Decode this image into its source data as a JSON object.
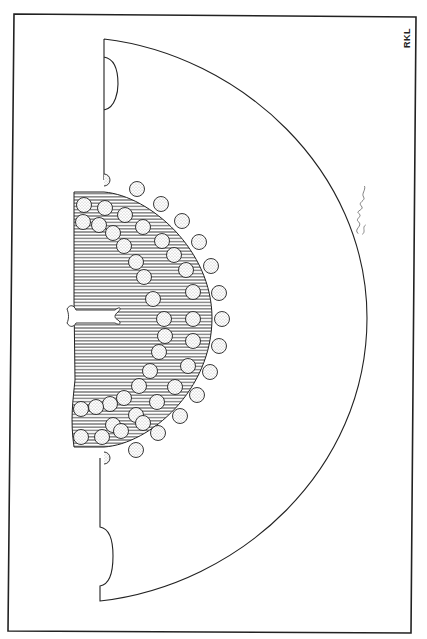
{
  "figure": {
    "type": "archaeological line drawing",
    "stroke_color": "#222222",
    "fill_color": "#ffffff"
  },
  "labels": {
    "initials": "RKL",
    "signature": "signature (handwritten)"
  },
  "frame": {
    "points": [
      [
        14,
        14
      ],
      [
        416,
        17
      ],
      [
        411,
        633
      ],
      [
        8,
        631
      ]
    ]
  },
  "axe": {
    "top_corner": [
      104,
      39
    ],
    "bottom_corner": [
      100,
      601
    ],
    "blade_apex": [
      367,
      315
    ],
    "top_notch": {
      "y1": 57,
      "y2": 110,
      "bulge_x": 118
    },
    "bottom_notch": {
      "y1": 527,
      "y2": 586,
      "bulge_x": 113
    }
  },
  "hatched_region": {
    "top_y": 192,
    "bottom_y": 447,
    "left_x": 74,
    "right_x": 212,
    "line_spacing": 3.2
  },
  "perforations": {
    "radius": 7.5,
    "outer_row": [
      [
        137,
        189
      ],
      [
        161,
        204
      ],
      [
        182,
        221
      ],
      [
        199,
        242
      ],
      [
        211,
        266
      ],
      [
        219,
        293
      ],
      [
        222,
        319
      ],
      [
        219,
        346
      ],
      [
        210,
        372
      ],
      [
        197,
        395
      ],
      [
        180,
        416
      ],
      [
        158,
        433
      ],
      [
        136,
        450
      ]
    ],
    "inner_row": [
      [
        84,
        205
      ],
      [
        105,
        208
      ],
      [
        125,
        215
      ],
      [
        143,
        227
      ],
      [
        162,
        241
      ],
      [
        174,
        255
      ],
      [
        186,
        270
      ],
      [
        193,
        292
      ],
      [
        193,
        319
      ],
      [
        193,
        341
      ],
      [
        188,
        366
      ],
      [
        175,
        387
      ],
      [
        157,
        402
      ],
      [
        136,
        415
      ],
      [
        113,
        425
      ]
    ],
    "diagonal_row": [
      [
        83,
        222
      ],
      [
        99,
        225
      ],
      [
        113,
        233
      ],
      [
        124,
        246
      ],
      [
        136,
        262
      ],
      [
        144,
        277
      ],
      [
        153,
        299
      ],
      [
        164,
        319
      ],
      [
        165,
        336
      ],
      [
        159,
        352
      ],
      [
        150,
        371
      ],
      [
        139,
        386
      ],
      [
        124,
        398
      ],
      [
        110,
        404
      ],
      [
        96,
        407
      ],
      [
        81,
        409
      ]
    ],
    "bottom_row": [
      [
        81,
        437
      ],
      [
        102,
        437
      ],
      [
        121,
        431
      ],
      [
        143,
        423
      ]
    ],
    "edge_half_circles": [
      [
        104,
        180
      ],
      [
        104,
        458
      ]
    ]
  }
}
